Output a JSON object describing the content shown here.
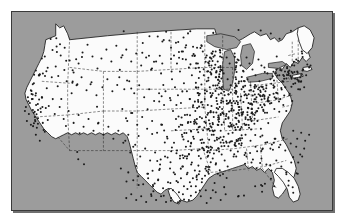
{
  "figure": {
    "kind": "dot-density-map",
    "caption": "",
    "frame_color": "#3a3a3a",
    "background_color": "#9c9c9c",
    "land_color": "#fbfbfb",
    "dot_color": "#1b1b1b",
    "border_color": "#1a1a1a"
  },
  "chart_data": {
    "type": "scatter",
    "title": "",
    "subtitle": "",
    "xlabel": "",
    "ylabel": "",
    "legend": [],
    "annotations": [],
    "grid": false,
    "region": "Contiguous United States",
    "projection_hint": "equal-area-like continental US outline",
    "xlim": [
      0,
      322
    ],
    "ylim": [
      0,
      200
    ],
    "marker": {
      "shape": "circle",
      "size_px": 1.35,
      "color": "#1b1b1b"
    },
    "density_notes": [
      {
        "region": "Great Lakes / Upper Midwest",
        "density": "very high"
      },
      {
        "region": "Ohio Valley / Indiana / Illinois",
        "density": "very high"
      },
      {
        "region": "Northeast Corridor",
        "density": "high"
      },
      {
        "region": "Mid-South / Missouri / Arkansas",
        "density": "moderate"
      },
      {
        "region": "Gulf Coast / Texas",
        "density": "moderate"
      },
      {
        "region": "Coastal California",
        "density": "moderate-high"
      },
      {
        "region": "Mountain West / Great Basin",
        "density": "very low"
      },
      {
        "region": "Northern Plains",
        "density": "low"
      },
      {
        "region": "Southeast / Florida",
        "density": "low"
      }
    ],
    "points": [
      [
        30,
        47
      ],
      [
        24,
        59
      ],
      [
        27,
        64
      ],
      [
        22,
        72
      ],
      [
        19,
        79
      ],
      [
        16,
        86
      ],
      [
        18,
        92
      ],
      [
        14,
        96
      ],
      [
        21,
        99
      ],
      [
        17,
        103
      ],
      [
        23,
        106
      ],
      [
        15,
        110
      ],
      [
        19,
        114
      ],
      [
        25,
        117
      ],
      [
        13,
        100
      ],
      [
        20,
        88
      ],
      [
        26,
        93
      ],
      [
        29,
        101
      ],
      [
        31,
        112
      ],
      [
        24,
        124
      ],
      [
        28,
        130
      ],
      [
        33,
        121
      ],
      [
        36,
        109
      ],
      [
        34,
        97
      ],
      [
        30,
        86
      ],
      [
        35,
        77
      ],
      [
        40,
        66
      ],
      [
        44,
        55
      ],
      [
        49,
        44
      ],
      [
        53,
        36
      ],
      [
        58,
        49
      ],
      [
        62,
        61
      ],
      [
        67,
        52
      ],
      [
        71,
        41
      ],
      [
        76,
        33
      ],
      [
        81,
        45
      ],
      [
        86,
        57
      ],
      [
        90,
        47
      ],
      [
        95,
        38
      ],
      [
        100,
        50
      ],
      [
        55,
        70
      ],
      [
        60,
        82
      ],
      [
        65,
        74
      ],
      [
        70,
        66
      ],
      [
        75,
        79
      ],
      [
        80,
        71
      ],
      [
        85,
        84
      ],
      [
        91,
        76
      ],
      [
        96,
        68
      ],
      [
        101,
        80
      ],
      [
        46,
        75
      ],
      [
        41,
        88
      ],
      [
        37,
        95
      ],
      [
        43,
        103
      ],
      [
        48,
        96
      ],
      [
        52,
        108
      ],
      [
        57,
        100
      ],
      [
        62,
        112
      ],
      [
        67,
        104
      ],
      [
        72,
        116
      ],
      [
        77,
        108
      ],
      [
        82,
        120
      ],
      [
        87,
        112
      ],
      [
        92,
        124
      ],
      [
        97,
        116
      ],
      [
        102,
        128
      ],
      [
        107,
        120
      ],
      [
        112,
        132
      ],
      [
        117,
        124
      ],
      [
        122,
        136
      ],
      [
        105,
        34
      ],
      [
        110,
        46
      ],
      [
        115,
        38
      ],
      [
        120,
        50
      ],
      [
        125,
        42
      ],
      [
        130,
        54
      ],
      [
        135,
        46
      ],
      [
        140,
        58
      ],
      [
        145,
        50
      ],
      [
        150,
        62
      ],
      [
        108,
        66
      ],
      [
        113,
        78
      ],
      [
        118,
        70
      ],
      [
        123,
        82
      ],
      [
        128,
        74
      ],
      [
        133,
        86
      ],
      [
        138,
        78
      ],
      [
        143,
        90
      ],
      [
        148,
        82
      ],
      [
        153,
        94
      ],
      [
        111,
        98
      ],
      [
        116,
        110
      ],
      [
        121,
        102
      ],
      [
        126,
        114
      ],
      [
        131,
        106
      ],
      [
        136,
        118
      ],
      [
        141,
        110
      ],
      [
        146,
        122
      ],
      [
        151,
        114
      ],
      [
        156,
        126
      ],
      [
        114,
        130
      ],
      [
        119,
        142
      ],
      [
        124,
        134
      ],
      [
        129,
        146
      ],
      [
        134,
        138
      ],
      [
        139,
        150
      ],
      [
        144,
        142
      ],
      [
        149,
        154
      ],
      [
        154,
        146
      ],
      [
        159,
        158
      ],
      [
        117,
        162
      ],
      [
        122,
        170
      ],
      [
        127,
        166
      ],
      [
        132,
        174
      ],
      [
        137,
        168
      ],
      [
        142,
        176
      ],
      [
        147,
        170
      ],
      [
        152,
        178
      ],
      [
        157,
        172
      ],
      [
        162,
        180
      ],
      [
        160,
        36
      ],
      [
        163,
        44
      ],
      [
        166,
        52
      ],
      [
        169,
        60
      ],
      [
        172,
        40
      ],
      [
        175,
        48
      ],
      [
        178,
        56
      ],
      [
        181,
        64
      ],
      [
        184,
        44
      ],
      [
        187,
        52
      ],
      [
        161,
        68
      ],
      [
        164,
        76
      ],
      [
        167,
        84
      ],
      [
        170,
        92
      ],
      [
        173,
        72
      ],
      [
        176,
        80
      ],
      [
        179,
        88
      ],
      [
        182,
        96
      ],
      [
        185,
        76
      ],
      [
        188,
        84
      ],
      [
        162,
        100
      ],
      [
        165,
        108
      ],
      [
        168,
        116
      ],
      [
        171,
        124
      ],
      [
        174,
        104
      ],
      [
        177,
        112
      ],
      [
        180,
        120
      ],
      [
        183,
        128
      ],
      [
        186,
        108
      ],
      [
        189,
        116
      ],
      [
        163,
        132
      ],
      [
        166,
        140
      ],
      [
        169,
        148
      ],
      [
        172,
        156
      ],
      [
        175,
        136
      ],
      [
        178,
        144
      ],
      [
        181,
        152
      ],
      [
        184,
        160
      ],
      [
        187,
        140
      ],
      [
        190,
        148
      ],
      [
        164,
        164
      ],
      [
        167,
        172
      ],
      [
        170,
        168
      ],
      [
        173,
        176
      ],
      [
        176,
        164
      ],
      [
        179,
        172
      ],
      [
        182,
        168
      ],
      [
        185,
        176
      ],
      [
        188,
        164
      ],
      [
        191,
        172
      ],
      [
        192,
        40
      ],
      [
        195,
        46
      ],
      [
        198,
        52
      ],
      [
        201,
        58
      ],
      [
        204,
        44
      ],
      [
        207,
        50
      ],
      [
        210,
        56
      ],
      [
        213,
        62
      ],
      [
        216,
        46
      ],
      [
        219,
        52
      ],
      [
        193,
        64
      ],
      [
        196,
        70
      ],
      [
        199,
        76
      ],
      [
        202,
        82
      ],
      [
        205,
        66
      ],
      [
        208,
        72
      ],
      [
        211,
        78
      ],
      [
        214,
        84
      ],
      [
        217,
        68
      ],
      [
        220,
        74
      ],
      [
        194,
        88
      ],
      [
        197,
        94
      ],
      [
        200,
        100
      ],
      [
        203,
        106
      ],
      [
        206,
        90
      ],
      [
        209,
        96
      ],
      [
        212,
        102
      ],
      [
        215,
        108
      ],
      [
        218,
        92
      ],
      [
        221,
        98
      ],
      [
        195,
        112
      ],
      [
        198,
        118
      ],
      [
        201,
        124
      ],
      [
        204,
        130
      ],
      [
        207,
        114
      ],
      [
        210,
        120
      ],
      [
        213,
        126
      ],
      [
        216,
        132
      ],
      [
        219,
        116
      ],
      [
        222,
        122
      ],
      [
        196,
        136
      ],
      [
        199,
        142
      ],
      [
        202,
        148
      ],
      [
        205,
        154
      ],
      [
        208,
        138
      ],
      [
        211,
        144
      ],
      [
        214,
        150
      ],
      [
        217,
        156
      ],
      [
        220,
        140
      ],
      [
        223,
        146
      ],
      [
        224,
        42
      ],
      [
        227,
        48
      ],
      [
        230,
        54
      ],
      [
        233,
        60
      ],
      [
        236,
        46
      ],
      [
        239,
        52
      ],
      [
        242,
        58
      ],
      [
        245,
        64
      ],
      [
        248,
        48
      ],
      [
        251,
        54
      ],
      [
        225,
        66
      ],
      [
        228,
        72
      ],
      [
        231,
        78
      ],
      [
        234,
        84
      ],
      [
        237,
        68
      ],
      [
        240,
        74
      ],
      [
        243,
        80
      ],
      [
        246,
        86
      ],
      [
        249,
        70
      ],
      [
        252,
        76
      ],
      [
        226,
        90
      ],
      [
        229,
        96
      ],
      [
        232,
        102
      ],
      [
        235,
        108
      ],
      [
        238,
        92
      ],
      [
        241,
        98
      ],
      [
        244,
        104
      ],
      [
        247,
        110
      ],
      [
        250,
        94
      ],
      [
        253,
        100
      ],
      [
        254,
        56
      ],
      [
        257,
        62
      ],
      [
        260,
        68
      ],
      [
        263,
        74
      ],
      [
        266,
        58
      ],
      [
        269,
        64
      ],
      [
        272,
        70
      ],
      [
        275,
        76
      ],
      [
        278,
        60
      ],
      [
        281,
        66
      ],
      [
        255,
        80
      ],
      [
        258,
        86
      ],
      [
        261,
        92
      ],
      [
        264,
        98
      ],
      [
        267,
        82
      ],
      [
        270,
        88
      ],
      [
        273,
        94
      ],
      [
        276,
        100
      ],
      [
        279,
        84
      ],
      [
        282,
        90
      ],
      [
        284,
        54
      ],
      [
        287,
        60
      ],
      [
        290,
        66
      ],
      [
        293,
        58
      ],
      [
        296,
        64
      ],
      [
        299,
        56
      ],
      [
        285,
        72
      ],
      [
        288,
        78
      ],
      [
        291,
        70
      ],
      [
        294,
        76
      ],
      [
        230,
        118
      ],
      [
        235,
        124
      ],
      [
        240,
        130
      ],
      [
        245,
        136
      ],
      [
        250,
        126
      ],
      [
        255,
        132
      ],
      [
        260,
        138
      ],
      [
        265,
        128
      ],
      [
        270,
        134
      ],
      [
        275,
        140
      ],
      [
        236,
        146
      ],
      [
        241,
        152
      ],
      [
        246,
        158
      ],
      [
        251,
        148
      ],
      [
        256,
        154
      ],
      [
        261,
        160
      ],
      [
        266,
        150
      ],
      [
        271,
        156
      ],
      [
        276,
        162
      ],
      [
        281,
        152
      ],
      [
        283,
        120
      ],
      [
        287,
        128
      ],
      [
        291,
        122
      ],
      [
        295,
        130
      ],
      [
        299,
        124
      ],
      [
        286,
        136
      ],
      [
        290,
        144
      ],
      [
        294,
        138
      ],
      [
        288,
        152
      ],
      [
        292,
        146
      ],
      [
        185,
        182
      ],
      [
        190,
        186
      ],
      [
        195,
        180
      ],
      [
        200,
        188
      ],
      [
        205,
        182
      ],
      [
        210,
        190
      ],
      [
        215,
        184
      ],
      [
        172,
        184
      ],
      [
        178,
        190
      ],
      [
        168,
        182
      ],
      [
        150,
        186
      ],
      [
        155,
        192
      ],
      [
        160,
        188
      ],
      [
        145,
        190
      ],
      [
        140,
        184
      ],
      [
        135,
        192
      ],
      [
        130,
        186
      ],
      [
        125,
        190
      ],
      [
        120,
        184
      ],
      [
        115,
        188
      ]
    ]
  }
}
